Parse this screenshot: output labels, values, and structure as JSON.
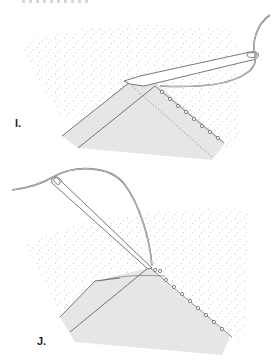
{
  "figure": {
    "steps": [
      {
        "id": "I",
        "label": "I.",
        "description": "Needle inserted through folded fabric edge with blanket stitches along edge"
      },
      {
        "id": "J",
        "label": "J.",
        "description": "Needle pulled up through fabric, thread looping above, stitches continuing along edge"
      }
    ],
    "colors": {
      "background": "#ffffff",
      "fabric_stipple": "#c8c8c8",
      "fold_fill": "#e6e6e6",
      "outline": "#555555",
      "needle_fill": "#ffffff"
    }
  }
}
